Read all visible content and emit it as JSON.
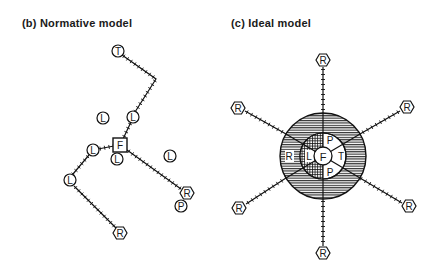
{
  "panels": {
    "b": {
      "title": "(b) Normative model",
      "nodes": {
        "T": "T",
        "F": "F",
        "L": "L",
        "R": "R",
        "P": "P"
      }
    },
    "c": {
      "title": "(c) Ideal model",
      "zones": {
        "center": "F",
        "inner": [
          "L",
          "P",
          "T",
          "P"
        ],
        "outer": [
          "R"
        ]
      },
      "nodes": {
        "R": "R"
      }
    }
  },
  "legend_meaning": {
    "F": "F",
    "L": "L",
    "R": "R",
    "P": "P",
    "T": "T"
  }
}
